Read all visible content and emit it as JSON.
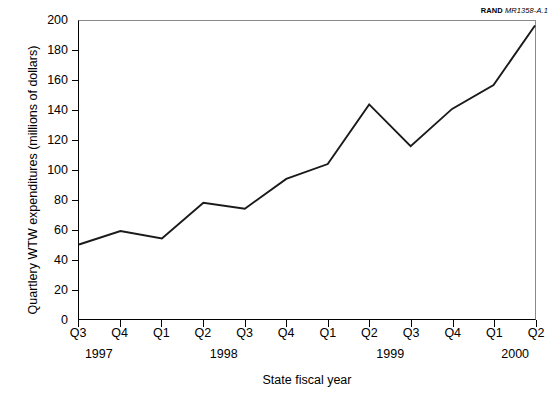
{
  "figure": {
    "source_credit_mark": "RAND",
    "source_credit_doc": "MR1358-A.1"
  },
  "chart_data": {
    "type": "line",
    "title": "",
    "xlabel": "State fiscal year",
    "ylabel": "Quartlery WTW expenditures (millions of dollars)",
    "categories": [
      "Q3",
      "Q4",
      "Q1",
      "Q2",
      "Q3",
      "Q4",
      "Q1",
      "Q2",
      "Q3",
      "Q4",
      "Q1",
      "Q2"
    ],
    "values": [
      50,
      59,
      54,
      78,
      74,
      94,
      104,
      144,
      116,
      141,
      157,
      197
    ],
    "year_groups": [
      {
        "label": "1997",
        "start_index": 0,
        "end_index": 1
      },
      {
        "label": "1998",
        "start_index": 2,
        "end_index": 5
      },
      {
        "label": "1999",
        "start_index": 6,
        "end_index": 9
      },
      {
        "label": "2000",
        "start_index": 10,
        "end_index": 11
      }
    ],
    "ylim": [
      0,
      200
    ],
    "yticks": [
      0,
      20,
      40,
      60,
      80,
      100,
      120,
      140,
      160,
      180,
      200
    ],
    "ytick_labels": [
      "0",
      "20",
      "40",
      "60",
      "80",
      "100",
      "120",
      "140",
      "160",
      "180",
      "200"
    ],
    "grid": false,
    "legend": null,
    "line_color": "#1a1a1a"
  }
}
